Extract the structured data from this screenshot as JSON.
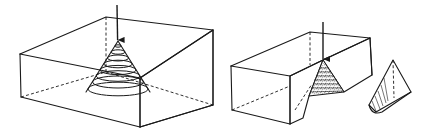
{
  "figure": {
    "description": "Hertzian cone fracture: point load on a glass block produces a conical crack; sectioned block shows the cone removed",
    "panels": [
      {
        "id": "left",
        "label": "Block with conical fracture under point load",
        "elements": [
          "load-arrow",
          "transparent-block",
          "nested-cone-rings",
          "stippled-side-face"
        ]
      },
      {
        "id": "right",
        "label": "Sectioned block with cone extracted",
        "elements": [
          "load-arrow",
          "cut-block",
          "conical-groove",
          "extracted-cone"
        ]
      }
    ],
    "colors": {
      "ink": "#1a1a1a",
      "background": "#ffffff"
    },
    "cone_ring_count": 8
  }
}
